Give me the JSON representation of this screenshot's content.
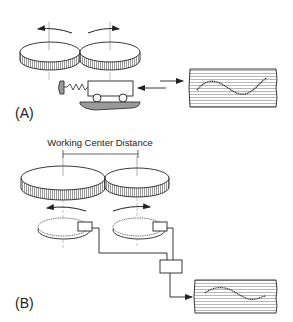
{
  "panels": {
    "a": {
      "label": "(A)",
      "components": [
        "gear-pair",
        "rotation-arrows",
        "spring-loaded-carriage",
        "recorder-chart"
      ]
    },
    "b": {
      "label": "(B)",
      "dimension_label": "Working Center Distance",
      "components": [
        "gear-pair",
        "rotation-arrows",
        "encoder-dials",
        "signal-processor",
        "recorder-chart"
      ]
    }
  },
  "colors": {
    "line": "#222222",
    "shade": "#9a9a9a",
    "chart_lines": "#8a8a8a",
    "background": "#ffffff"
  }
}
